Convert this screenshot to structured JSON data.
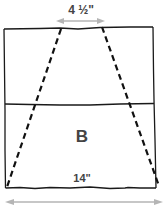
{
  "diagram": {
    "panel_label": "B",
    "top_dimension": "4 ½\"",
    "bottom_dimension": "14\"",
    "colors": {
      "outline": "#1a1a1a",
      "dashed": "#111111",
      "arrow": "#b5b5b5",
      "text": "#444444"
    }
  }
}
